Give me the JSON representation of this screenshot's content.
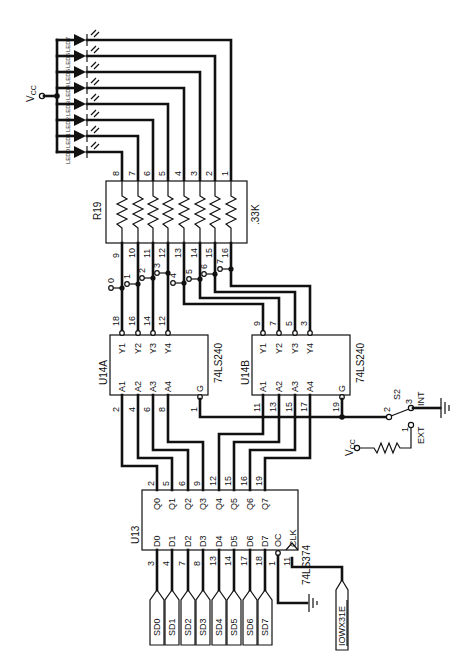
{
  "diagram": {
    "type": "electronic-schematic",
    "orientation": "rotated 90deg (text reads bottom-to-top)",
    "power": {
      "vcc_label": "VCC"
    },
    "leds": {
      "labels": [
        "LED0",
        "LED1",
        "LED2",
        "LED3",
        "LED4",
        "LED5",
        "LED6",
        "LED7"
      ]
    },
    "resistor_network": {
      "ref": "R19",
      "value": ".33K",
      "top_pins": [
        "8",
        "7",
        "6",
        "5",
        "4",
        "3",
        "2",
        "1"
      ],
      "bottom_pins": [
        "9",
        "10",
        "11",
        "12",
        "13",
        "14",
        "15",
        "16"
      ]
    },
    "test_points": [
      "0",
      "1",
      "2",
      "3",
      "4",
      "5",
      "6",
      "7"
    ],
    "u14a": {
      "ref": "U14A",
      "part": "74LS240",
      "y_pins": [
        {
          "name": "Y1",
          "num": "18"
        },
        {
          "name": "Y2",
          "num": "16"
        },
        {
          "name": "Y3",
          "num": "14"
        },
        {
          "name": "Y4",
          "num": "12"
        }
      ],
      "a_pins": [
        {
          "name": "A1",
          "num": "2"
        },
        {
          "name": "A2",
          "num": "4"
        },
        {
          "name": "A3",
          "num": "6"
        },
        {
          "name": "A4",
          "num": "8"
        }
      ],
      "g_pin": {
        "name": "G",
        "num": "1"
      }
    },
    "u14b": {
      "ref": "U14B",
      "part": "74LS240",
      "y_pins": [
        {
          "name": "Y1",
          "num": "9"
        },
        {
          "name": "Y2",
          "num": "7"
        },
        {
          "name": "Y3",
          "num": "5"
        },
        {
          "name": "Y4",
          "num": "3"
        }
      ],
      "a_pins": [
        {
          "name": "A1",
          "num": "11"
        },
        {
          "name": "A2",
          "num": "13"
        },
        {
          "name": "A3",
          "num": "15"
        },
        {
          "name": "A4",
          "num": "17"
        }
      ],
      "g_pin": {
        "name": "G",
        "num": "19"
      }
    },
    "switch": {
      "ref": "S2",
      "pins": [
        "2",
        "3",
        "1"
      ],
      "int_label": "INT",
      "ext_label": "EXT",
      "vcc_label": "VCC"
    },
    "u13": {
      "ref": "U13",
      "part": "74LS374",
      "q_pins": [
        {
          "name": "Q0",
          "num": "2"
        },
        {
          "name": "Q1",
          "num": "5"
        },
        {
          "name": "Q2",
          "num": "6"
        },
        {
          "name": "Q3",
          "num": "9"
        },
        {
          "name": "Q4",
          "num": "12"
        },
        {
          "name": "Q5",
          "num": "15"
        },
        {
          "name": "Q6",
          "num": "16"
        },
        {
          "name": "Q7",
          "num": "19"
        }
      ],
      "d_pins": [
        {
          "name": "D0",
          "num": "3"
        },
        {
          "name": "D1",
          "num": "4"
        },
        {
          "name": "D2",
          "num": "7"
        },
        {
          "name": "D3",
          "num": "8"
        },
        {
          "name": "D4",
          "num": "13"
        },
        {
          "name": "D5",
          "num": "14"
        },
        {
          "name": "D6",
          "num": "17"
        },
        {
          "name": "D7",
          "num": "18"
        }
      ],
      "oc_pin": {
        "name": "OC",
        "num": "1"
      },
      "clk_pin": {
        "name": "CLK",
        "num": "11"
      }
    },
    "bus_connectors": [
      "SD0",
      "SD1",
      "SD2",
      "SD3",
      "SD4",
      "SD5",
      "SD6",
      "SD7"
    ],
    "strobe_connector": "IOWX31E"
  }
}
